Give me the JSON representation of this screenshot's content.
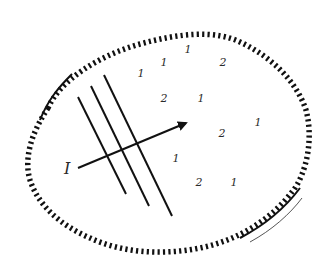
{
  "diagram": {
    "boundary": {
      "style": "hatched",
      "color": "#111111"
    },
    "wavefronts": {
      "count": 3,
      "color": "#111111"
    },
    "ray": {
      "label": "I",
      "color": "#111111"
    },
    "particle_labels": [
      {
        "text": "1",
        "x": 141,
        "y": 77
      },
      {
        "text": "1",
        "x": 164,
        "y": 66
      },
      {
        "text": "1",
        "x": 188,
        "y": 53
      },
      {
        "text": "2",
        "x": 223,
        "y": 66
      },
      {
        "text": "2",
        "x": 164,
        "y": 102
      },
      {
        "text": "1",
        "x": 201,
        "y": 102
      },
      {
        "text": "2",
        "x": 222,
        "y": 137
      },
      {
        "text": "1",
        "x": 258,
        "y": 126
      },
      {
        "text": "1",
        "x": 176,
        "y": 162
      },
      {
        "text": "2",
        "x": 199,
        "y": 186
      },
      {
        "text": "1",
        "x": 234,
        "y": 186
      }
    ]
  }
}
